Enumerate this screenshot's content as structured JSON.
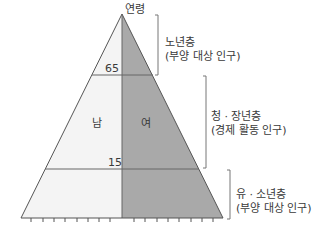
{
  "diagram": {
    "type": "population-pyramid",
    "axis_label": "연령",
    "age_marks": [
      {
        "value": "65",
        "label": "65"
      },
      {
        "value": "15",
        "label": "15"
      }
    ],
    "sides": {
      "left": {
        "label": "남",
        "color": "#f4f4f4"
      },
      "right": {
        "label": "여",
        "color": "#a9a9a9"
      }
    },
    "groups": [
      {
        "name": "노년층",
        "description": "(부양 대상 인구)"
      },
      {
        "name": "청 · 장년층",
        "description": "(경제 활동 인구)"
      },
      {
        "name": "유 · 소년층",
        "description": "(부양 대상 인구)"
      }
    ],
    "base_ticks_per_side": 8,
    "colors": {
      "outline": "#555555",
      "divider": "#666666",
      "bracket": "#777777"
    }
  }
}
